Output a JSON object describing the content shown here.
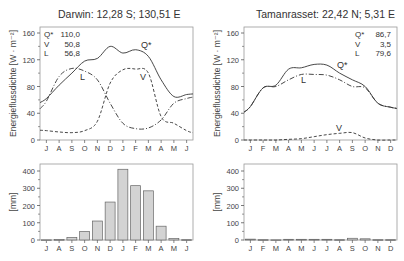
{
  "chart_data": [
    {
      "type": "line",
      "title": "Darwin: 12,28 S; 130,51 E",
      "ylabel": "Energieflussdichte [W · m⁻²]",
      "xlabel": "",
      "ylim": [
        0,
        160
      ],
      "yticks": [
        0,
        40,
        80,
        120,
        160
      ],
      "categories": [
        "J",
        "A",
        "S",
        "O",
        "N",
        "D",
        "J",
        "F",
        "M",
        "A",
        "M",
        "J"
      ],
      "legend": [
        {
          "name": "Q*",
          "value": "110,0"
        },
        {
          "name": "V",
          "value": "50,8"
        },
        {
          "name": "L",
          "value": "56,8"
        }
      ],
      "series": [
        {
          "name": "Q*",
          "style": "solid",
          "values": [
            62,
            82,
            100,
            118,
            122,
            140,
            130,
            135,
            125,
            90,
            65,
            68
          ]
        },
        {
          "name": "V",
          "style": "dashed",
          "values": [
            14,
            12,
            11,
            14,
            28,
            85,
            105,
            106,
            100,
            35,
            25,
            14
          ]
        },
        {
          "name": "L",
          "style": "dashdot",
          "values": [
            58,
            95,
            107,
            103,
            90,
            55,
            25,
            17,
            18,
            30,
            55,
            62
          ]
        }
      ],
      "annotations": [
        "Q*",
        "V",
        "L"
      ]
    },
    {
      "type": "bar",
      "title": "Darwin precipitation",
      "ylabel": "[mm]",
      "ylim": [
        0,
        400
      ],
      "yticks": [
        0,
        100,
        200,
        300,
        400
      ],
      "categories": [
        "J",
        "A",
        "S",
        "O",
        "N",
        "D",
        "J",
        "F",
        "M",
        "A",
        "M",
        "J"
      ],
      "values": [
        1,
        3,
        15,
        50,
        110,
        220,
        410,
        315,
        285,
        80,
        8,
        2
      ]
    },
    {
      "type": "line",
      "title": "Tamanrasset: 22,42 N;  5,31 E",
      "ylabel": "Energieflussdichte [W · m⁻²]",
      "xlabel": "",
      "ylim": [
        0,
        160
      ],
      "yticks": [
        0,
        40,
        80,
        120,
        160
      ],
      "categories": [
        "J",
        "F",
        "M",
        "A",
        "M",
        "J",
        "J",
        "A",
        "S",
        "O",
        "N",
        "D"
      ],
      "legend": [
        {
          "name": "Q*",
          "value": "86,7"
        },
        {
          "name": "V",
          "value": "3,5"
        },
        {
          "name": "L",
          "value": "79,6"
        }
      ],
      "series": [
        {
          "name": "Q*",
          "style": "solid",
          "values": [
            50,
            78,
            82,
            106,
            108,
            113,
            112,
            100,
            90,
            80,
            55,
            49
          ]
        },
        {
          "name": "V",
          "style": "dashed",
          "values": [
            0,
            0,
            0,
            1,
            2,
            5,
            8,
            10,
            11,
            3,
            0,
            0
          ]
        },
        {
          "name": "L",
          "style": "dashdot",
          "values": [
            50,
            78,
            80,
            90,
            98,
            98,
            97,
            90,
            80,
            78,
            55,
            49
          ]
        }
      ],
      "annotations": [
        "Q*",
        "L",
        "V"
      ]
    },
    {
      "type": "bar",
      "title": "Tamanrasset precipitation",
      "ylabel": "[mm]",
      "ylim": [
        0,
        400
      ],
      "yticks": [
        0,
        100,
        200,
        300,
        400
      ],
      "categories": [
        "J",
        "F",
        "M",
        "A",
        "M",
        "J",
        "J",
        "A",
        "S",
        "O",
        "N",
        "D"
      ],
      "values": [
        5,
        2,
        1,
        4,
        4,
        4,
        4,
        2,
        10,
        7,
        2,
        2
      ]
    }
  ],
  "charts": {
    "darwin_title": "Darwin: 12,28 S; 130,51 E",
    "tam_title": "Tamanrasset: 22,42 N;  5,31 E",
    "energy_ylabel": "Energieflussdichte [W · m⁻²]",
    "precip_ylabel": "[mm]"
  }
}
